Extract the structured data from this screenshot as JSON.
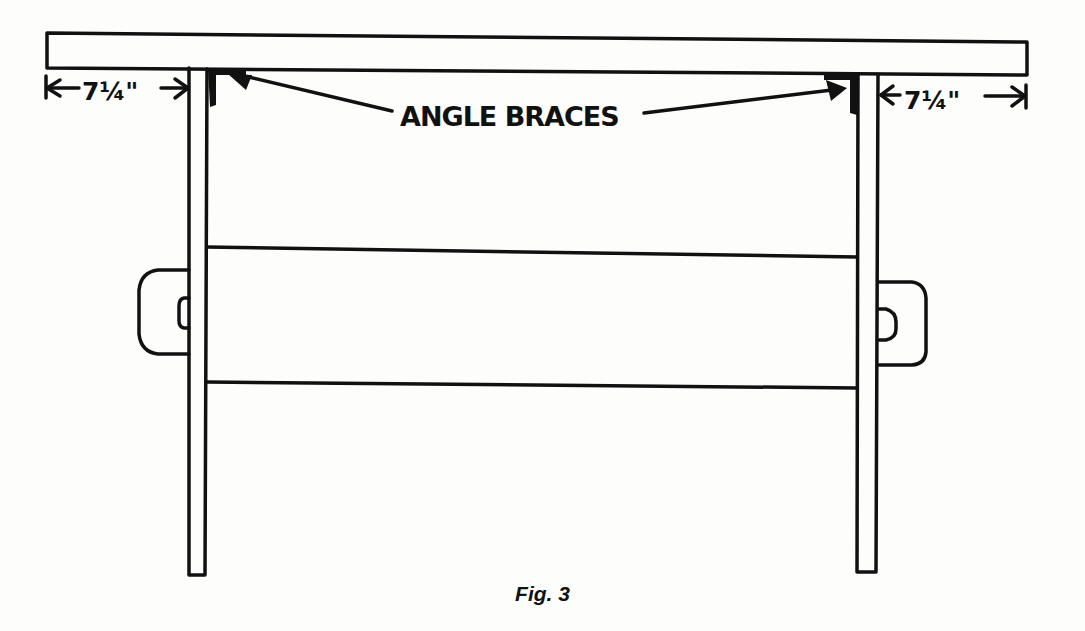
{
  "figure": {
    "caption": "Fig. 3",
    "colors": {
      "ink": "#111111",
      "paper": "#fdfdfc"
    }
  },
  "labels": {
    "angle_braces": "ANGLE BRACES",
    "left_dimension": "7¼\"",
    "right_dimension": "7¼\""
  },
  "parts": [
    {
      "name": "tabletop"
    },
    {
      "name": "left-leg"
    },
    {
      "name": "right-leg"
    },
    {
      "name": "stretcher"
    },
    {
      "name": "left-angle-brace"
    },
    {
      "name": "right-angle-brace"
    },
    {
      "name": "left-cleat"
    },
    {
      "name": "right-cleat"
    }
  ]
}
